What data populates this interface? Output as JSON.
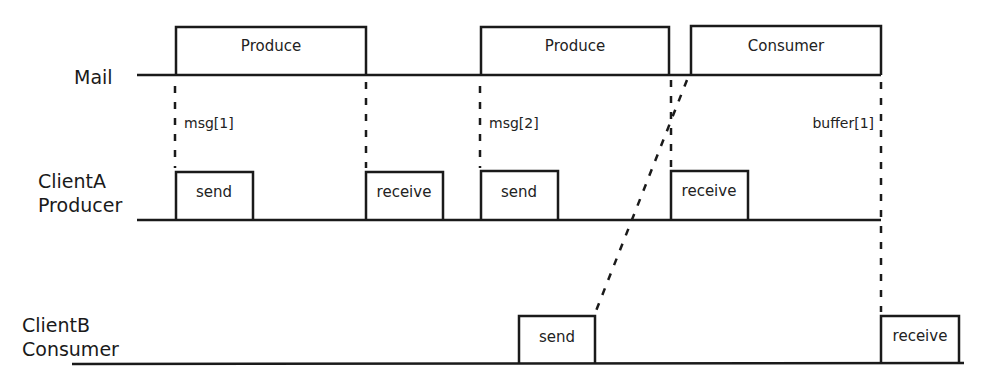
{
  "diagram": {
    "type": "timing-sequence",
    "colors": {
      "line": "#1a1a1a",
      "text": "#222222",
      "background": "#ffffff"
    },
    "lanes": [
      {
        "id": "mail",
        "label_lines": [
          "Mail"
        ]
      },
      {
        "id": "clientA",
        "label_lines": [
          "ClientA",
          "Producer"
        ]
      },
      {
        "id": "clientB",
        "label_lines": [
          "ClientB",
          "Consumer"
        ]
      }
    ],
    "mail_boxes": [
      {
        "label": "Produce"
      },
      {
        "label": "Produce"
      },
      {
        "label": "Consumer"
      }
    ],
    "clientA_boxes": [
      {
        "label": "send"
      },
      {
        "label": "receive"
      },
      {
        "label": "send"
      },
      {
        "label": "receive"
      }
    ],
    "clientB_boxes": [
      {
        "label": "send"
      },
      {
        "label": "receive"
      }
    ],
    "annotations": [
      {
        "label": "msg[1]"
      },
      {
        "label": "msg[2]"
      },
      {
        "label": "buffer[1]"
      }
    ]
  }
}
